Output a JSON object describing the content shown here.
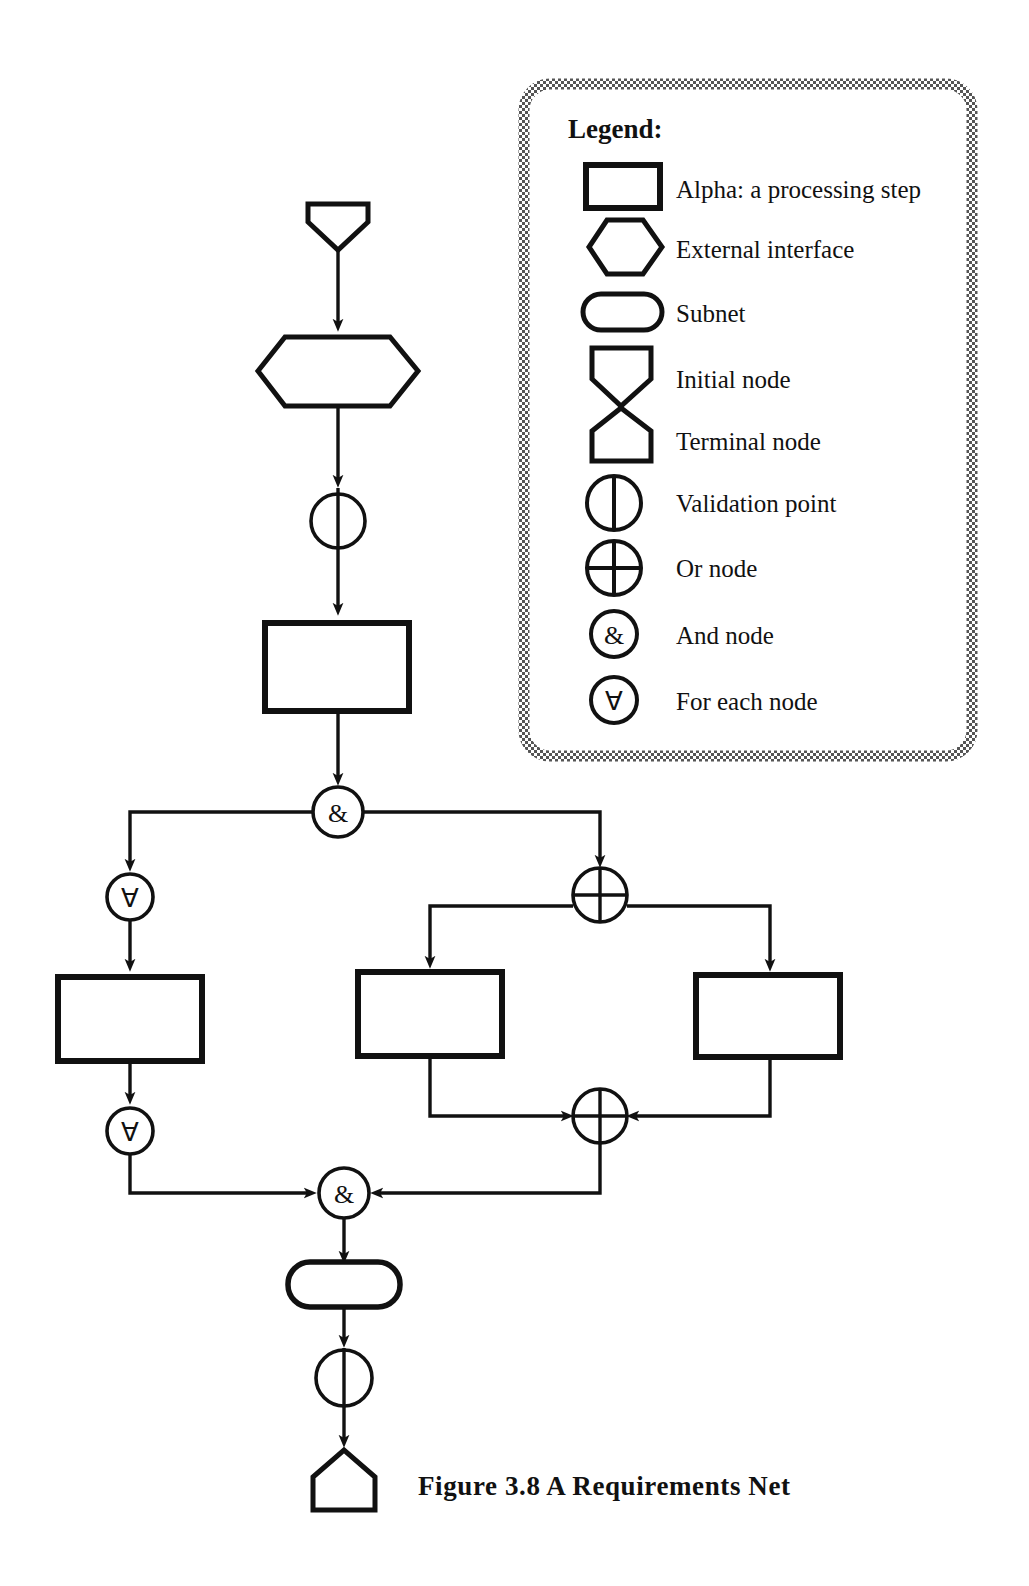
{
  "figure": {
    "caption": "Figure 3.8   A Requirements Net",
    "caption_number": "3.8",
    "caption_title": "A Requirements Net"
  },
  "legend": {
    "title": "Legend:",
    "items": [
      {
        "shape": "rectangle",
        "icon": "alpha-processing-step-icon",
        "label": "Alpha: a processing step"
      },
      {
        "shape": "hexagon",
        "icon": "external-interface-icon",
        "label": "External interface"
      },
      {
        "shape": "stadium",
        "icon": "subnet-icon",
        "label": "Subnet"
      },
      {
        "shape": "initial-node",
        "icon": "initial-node-icon",
        "label": "Initial node"
      },
      {
        "shape": "terminal-node",
        "icon": "terminal-node-icon",
        "label": "Terminal node"
      },
      {
        "shape": "circle-vbar",
        "icon": "validation-point-icon",
        "label": "Validation point"
      },
      {
        "shape": "circle-plus",
        "icon": "or-node-icon",
        "label": "Or node"
      },
      {
        "shape": "circle-amp",
        "icon": "and-node-icon",
        "label": "And node",
        "glyph": "&"
      },
      {
        "shape": "circle-forall",
        "icon": "for-each-node-icon",
        "label": "For each node",
        "glyph": "∀"
      }
    ]
  },
  "diagram": {
    "type": "requirements-net",
    "colors": {
      "ink": "#111111",
      "paper": "#ffffff"
    },
    "nodes": [
      {
        "id": "n1",
        "kind": "initial-node",
        "name": "initial-node"
      },
      {
        "id": "n2",
        "kind": "external-interface",
        "name": "external-interface-hexagon"
      },
      {
        "id": "n3",
        "kind": "validation-point",
        "name": "validation-point-upper"
      },
      {
        "id": "n4",
        "kind": "alpha",
        "name": "alpha-step-top"
      },
      {
        "id": "n5",
        "kind": "and-node",
        "name": "and-node-fork",
        "glyph": "&"
      },
      {
        "id": "n6",
        "kind": "for-each-node",
        "name": "for-each-node-upper",
        "glyph": "∀"
      },
      {
        "id": "n7",
        "kind": "alpha",
        "name": "alpha-step-left"
      },
      {
        "id": "n8",
        "kind": "for-each-node",
        "name": "for-each-node-lower",
        "glyph": "∀"
      },
      {
        "id": "n9",
        "kind": "or-node",
        "name": "or-node-split"
      },
      {
        "id": "n10",
        "kind": "alpha",
        "name": "alpha-step-middle"
      },
      {
        "id": "n11",
        "kind": "alpha",
        "name": "alpha-step-right"
      },
      {
        "id": "n12",
        "kind": "or-node",
        "name": "or-node-join"
      },
      {
        "id": "n13",
        "kind": "and-node",
        "name": "and-node-join",
        "glyph": "&"
      },
      {
        "id": "n14",
        "kind": "subnet",
        "name": "subnet"
      },
      {
        "id": "n15",
        "kind": "validation-point",
        "name": "validation-point-lower"
      },
      {
        "id": "n16",
        "kind": "terminal-node",
        "name": "terminal-node"
      }
    ],
    "edges": [
      {
        "from": "n1",
        "to": "n2"
      },
      {
        "from": "n2",
        "to": "n3"
      },
      {
        "from": "n3",
        "to": "n4"
      },
      {
        "from": "n4",
        "to": "n5"
      },
      {
        "from": "n5",
        "to": "n6"
      },
      {
        "from": "n5",
        "to": "n9"
      },
      {
        "from": "n6",
        "to": "n7"
      },
      {
        "from": "n7",
        "to": "n8"
      },
      {
        "from": "n8",
        "to": "n13"
      },
      {
        "from": "n9",
        "to": "n10"
      },
      {
        "from": "n9",
        "to": "n11"
      },
      {
        "from": "n10",
        "to": "n12"
      },
      {
        "from": "n11",
        "to": "n12"
      },
      {
        "from": "n12",
        "to": "n13"
      },
      {
        "from": "n13",
        "to": "n14"
      },
      {
        "from": "n14",
        "to": "n15"
      },
      {
        "from": "n15",
        "to": "n16"
      }
    ]
  }
}
